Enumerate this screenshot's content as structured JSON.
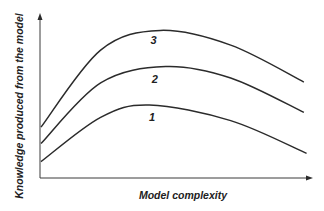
{
  "chart_data": {
    "type": "line",
    "title": "",
    "xlabel": "Model complexity",
    "ylabel": "Knowledge produced from the model",
    "xlim": [
      0,
      1
    ],
    "ylim": [
      0,
      1
    ],
    "grid": false,
    "ticks": false,
    "legend": "inline labels",
    "series": [
      {
        "name": "1",
        "x": [
          0.0,
          0.22,
          0.4,
          0.7,
          0.98
        ],
        "y": [
          0.1,
          0.37,
          0.445,
          0.35,
          0.15
        ],
        "label_at": [
          0.41,
          0.35
        ]
      },
      {
        "name": "2",
        "x": [
          0.0,
          0.22,
          0.46,
          0.7,
          0.97
        ],
        "y": [
          0.21,
          0.58,
          0.68,
          0.61,
          0.4
        ],
        "label_at": [
          0.42,
          0.58
        ]
      },
      {
        "name": "3",
        "x": [
          0.0,
          0.22,
          0.44,
          0.7,
          0.97
        ],
        "y": [
          0.31,
          0.78,
          0.9,
          0.81,
          0.585
        ],
        "label_at": [
          0.415,
          0.82
        ]
      }
    ]
  }
}
